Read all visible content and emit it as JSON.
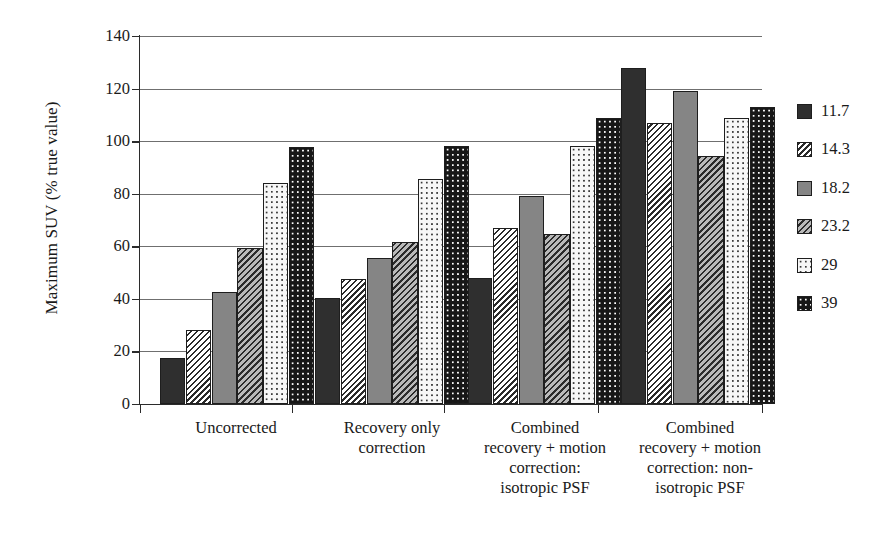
{
  "chart_data": {
    "type": "bar",
    "title": "",
    "xlabel": "",
    "ylabel": "Maximum SUV (% true value)",
    "ylim": [
      0,
      140
    ],
    "ytick_step": 20,
    "yticks": [
      0,
      20,
      40,
      60,
      80,
      100,
      120,
      140
    ],
    "ytick_labels": [
      "0",
      "20",
      "40",
      "60",
      "80",
      "100",
      "120",
      "140"
    ],
    "grid": true,
    "grid_axis": "y",
    "legend_position": "right",
    "legend_title": "",
    "categories": [
      "Uncorrected",
      "Recovery only\ncorrection",
      "Combined\nrecovery + motion\ncorrection:\nisotropic PSF",
      "Combined\nrecovery + motion\ncorrection: non-\nisotropic PSF"
    ],
    "series": [
      {
        "name": "11.7",
        "pattern": "dark-solid",
        "values": [
          17.5,
          40.3,
          48.0,
          128.0
        ]
      },
      {
        "name": "14.3",
        "pattern": "white-hatch",
        "values": [
          28.0,
          47.6,
          67.0,
          107.0
        ]
      },
      {
        "name": "18.2",
        "pattern": "gray-solid",
        "values": [
          42.5,
          55.7,
          79.0,
          119.0
        ]
      },
      {
        "name": "23.2",
        "pattern": "gray-hatch",
        "values": [
          59.5,
          61.8,
          64.8,
          94.5
        ]
      },
      {
        "name": "29",
        "pattern": "white-dot",
        "values": [
          84.2,
          85.6,
          98.2,
          108.8
        ]
      },
      {
        "name": "39",
        "pattern": "black-dot",
        "values": [
          97.8,
          98.2,
          109.0,
          113.0
        ]
      }
    ]
  },
  "colors": {
    "dark-solid": "#2f2f2f",
    "gray-solid": "#858585",
    "gray-hatch": "#b9b9b9",
    "white-hatch": "#ffffff",
    "white-dot": "#f7f7f7",
    "black-dot": "#171717",
    "axis": "#2b2b2b",
    "grid": "#6f6f6f"
  }
}
